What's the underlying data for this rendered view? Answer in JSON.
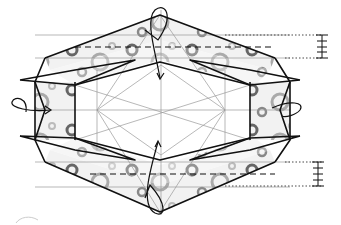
{
  "diagram": {
    "type": "origami-folding-step",
    "colors": {
      "outline": "#111111",
      "crease": "#8a8a8a",
      "paper_fill": "#eeeeee",
      "ring_dark": "#555555",
      "ring_light": "#b5b5b5",
      "background": "#ffffff"
    },
    "legend": {
      "fold_marks": "dashed valley-fold lines",
      "measure_marks": "dotted guides with tick scale"
    },
    "arrows": [
      {
        "name": "top-fold-arrow",
        "direction": "down"
      },
      {
        "name": "bottom-fold-arrow",
        "direction": "up"
      },
      {
        "name": "left-flip-arrow",
        "direction": "right"
      },
      {
        "name": "right-flip-arrow",
        "direction": "left"
      }
    ],
    "scales": [
      {
        "name": "top-scale",
        "ticks": 4
      },
      {
        "name": "bottom-scale",
        "ticks": 5
      }
    ]
  }
}
